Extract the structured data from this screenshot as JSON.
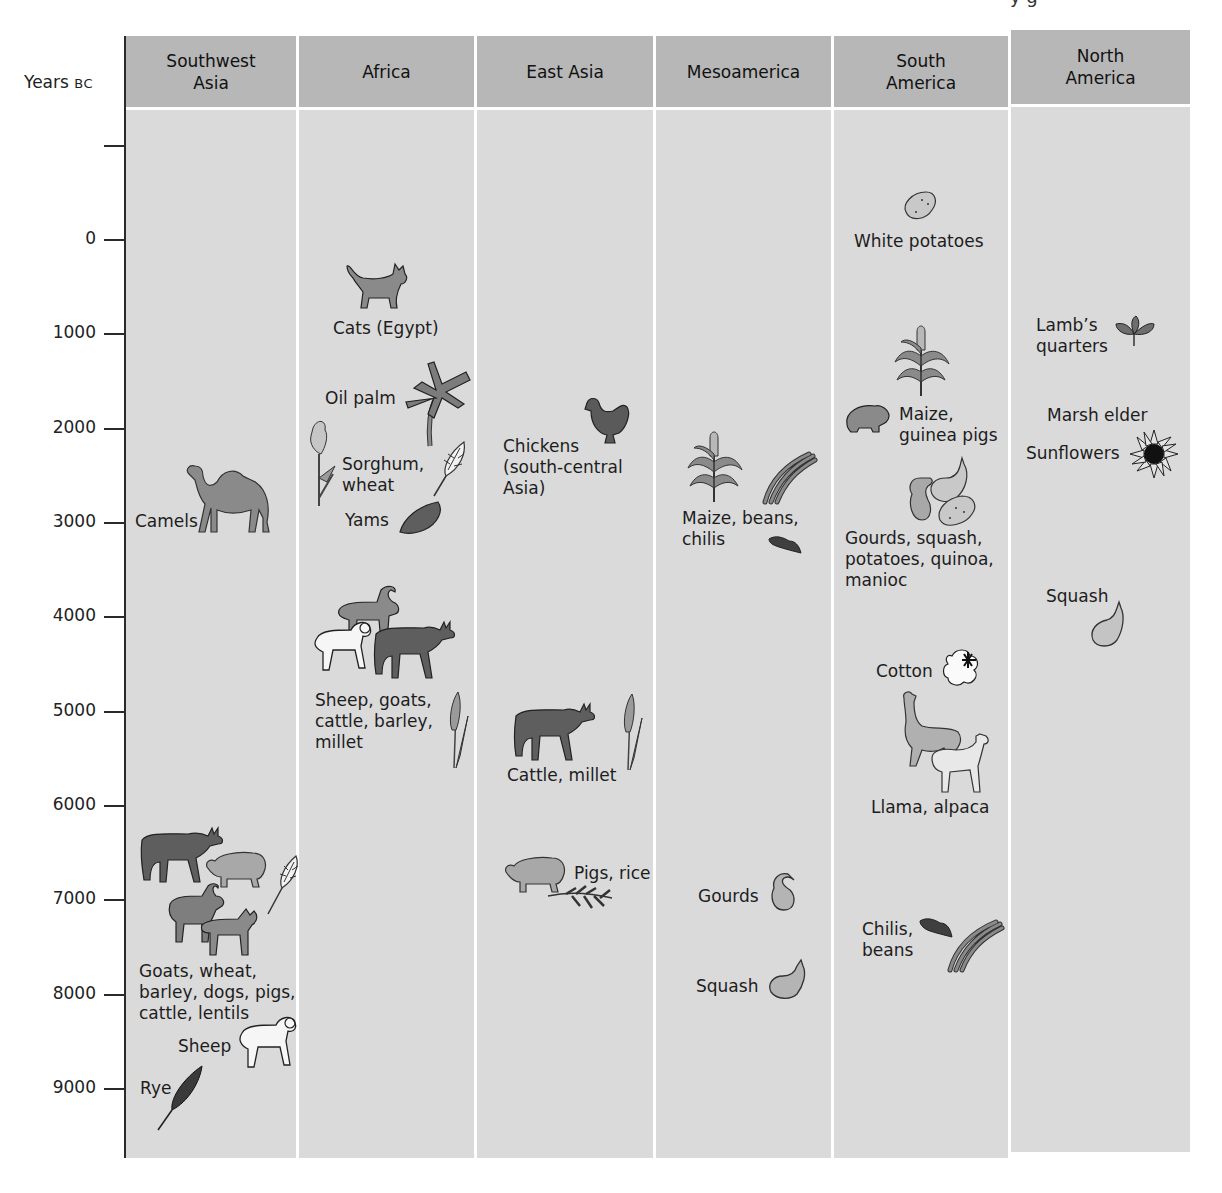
{
  "figure": {
    "clipped_top_text": "y g",
    "axis": {
      "title_main": "Years ",
      "title_unit": "BC",
      "ticks": [
        {
          "label": "",
          "y": 145
        },
        {
          "label": "0",
          "y": 239
        },
        {
          "label": "1000",
          "y": 333
        },
        {
          "label": "2000",
          "y": 428
        },
        {
          "label": "3000",
          "y": 522
        },
        {
          "label": "4000",
          "y": 616
        },
        {
          "label": "5000",
          "y": 711
        },
        {
          "label": "6000",
          "y": 805
        },
        {
          "label": "7000",
          "y": 899
        },
        {
          "label": "8000",
          "y": 994
        },
        {
          "label": "9000",
          "y": 1088
        }
      ]
    },
    "columns": [
      {
        "name": "Southwest\nAsia"
      },
      {
        "name": "Africa"
      },
      {
        "name": "East Asia"
      },
      {
        "name": "Mesoamerica"
      },
      {
        "name": "South\nAmerica"
      },
      {
        "name": "North\nAmerica"
      }
    ],
    "entries": {
      "southwest_asia": {
        "camels": "Camels",
        "goats_group": "Goats, wheat,\nbarley, dogs, pigs,\ncattle, lentils",
        "sheep": "Sheep",
        "rye": "Rye"
      },
      "africa": {
        "cats": "Cats (Egypt)",
        "oil_palm": "Oil palm",
        "sorghum": "Sorghum,\nwheat",
        "yams": "Yams",
        "sheep_group": "Sheep, goats,\ncattle, barley,\nmillet"
      },
      "east_asia": {
        "chickens": "Chickens\n(south-central\nAsia)",
        "cattle": "Cattle, millet",
        "pigs": "Pigs, rice"
      },
      "mesoamerica": {
        "maize": "Maize, beans,\nchilis",
        "gourds": "Gourds",
        "squash": "Squash"
      },
      "south_america": {
        "white_potatoes": "White potatoes",
        "maize": "Maize,\nguinea pigs",
        "gourds": "Gourds, squash,\npotatoes, quinoa,\nmanioc",
        "cotton": "Cotton",
        "llama": "Llama, alpaca",
        "chilis": "Chilis,\nbeans"
      },
      "north_america": {
        "lambs": "Lamb’s\nquarters",
        "marsh": "Marsh elder",
        "sunflowers": "Sunflowers",
        "squash": "Squash"
      }
    },
    "colors": {
      "header_bg": "#b7b7b7",
      "body_bg": "#dadada",
      "separator": "#ffffff",
      "dark_fill": "#5e5e5e",
      "mid_fill": "#8a8a8a",
      "light_fill": "#b0b0b0",
      "white_fill": "#f4f4f4"
    }
  }
}
